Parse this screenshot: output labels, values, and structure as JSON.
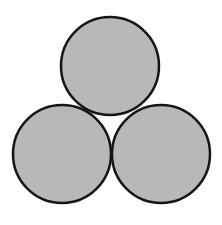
{
  "diagram": {
    "fill_color": "#b8b8b8",
    "stroke_color": "#151515",
    "background": "#ffffff",
    "circles": [
      {
        "id": "top",
        "cx": 110,
        "cy": 66,
        "r": 49
      },
      {
        "id": "bottom-left",
        "cx": 62,
        "cy": 154,
        "r": 49
      },
      {
        "id": "bottom-right",
        "cx": 161,
        "cy": 154,
        "r": 49
      }
    ]
  }
}
